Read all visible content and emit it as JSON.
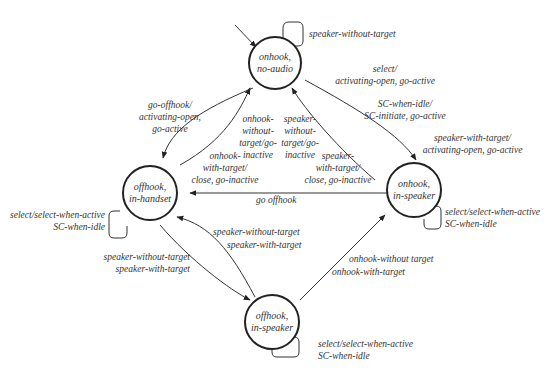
{
  "states": {
    "onhook_no_audio": {
      "line1": "onhook,",
      "line2": "no-audio"
    },
    "offhook_in_handset": {
      "line1": "offhook,",
      "line2": "in-handset"
    },
    "onhook_in_speaker": {
      "line1": "onhook,",
      "line2": "in-speaker"
    },
    "offhook_in_speaker": {
      "line1": "offhook,",
      "line2": "in-speaker"
    }
  },
  "transitions": {
    "no_audio_self": "speaker-without-target",
    "no_audio_to_speaker": {
      "l1": "select/",
      "l2": "activating-open, go-active",
      "l3": "SC-when-idle/",
      "l4": "SC-initiate, go-active"
    },
    "speaker_with_target": {
      "l1": "speaker-with-target/",
      "l2": "activating-open, go-active"
    },
    "no_audio_to_handset": {
      "l1": "go-offhook/",
      "l2": "activating-open,",
      "l3": "go-active"
    },
    "handset_to_no_audio_a": {
      "l1": "onhook-",
      "l2": "without-",
      "l3": "target/go-",
      "l4": "inactive"
    },
    "handset_to_no_audio_b": {
      "l1": "onhook-",
      "l2": "with-target/",
      "l3": "close, go-inactive"
    },
    "speaker_to_no_audio_a": {
      "l1": "speaker-",
      "l2": "without-",
      "l3": "target/go-",
      "l4": "inactive"
    },
    "speaker_to_no_audio_b": {
      "l1": "speaker-",
      "l2": "with-target/",
      "l3": "close, go-inactive"
    },
    "go_offhook": "go offhook",
    "handset_self": {
      "l1": "select/select-when-active",
      "l2": "SC-when-idle"
    },
    "onhook_speaker_self": {
      "l1": "select/select-when-active",
      "l2": "SC-when-idle"
    },
    "handset_to_offspeaker": {
      "l1": "speaker-without-target",
      "l2": "speaker-with-target"
    },
    "offspeaker_to_handset": {
      "l1": "speaker-without-target",
      "l2": "speaker-with-target"
    },
    "offspeaker_to_onspeaker": {
      "l1": "onhook-without target",
      "l2": "onhook-with-target"
    },
    "offspeaker_self": {
      "l1": "select/select-when-active",
      "l2": "SC-when-idle"
    }
  }
}
